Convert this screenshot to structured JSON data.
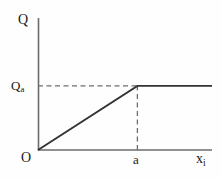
{
  "figure": {
    "background_color": "#fefefe",
    "line_color": "#333333",
    "dash_color": "#6e6e6e",
    "axis_color": "#6b6b6b",
    "text_color": "#1a1a1a"
  },
  "labels": {
    "y_axis": "Q",
    "y_tick_base": "Q",
    "y_tick_sub": "a",
    "origin": "O",
    "x_tick": "a",
    "x_axis_base": "x",
    "x_axis_sub": "i"
  },
  "chart_data": {
    "type": "line",
    "title": "",
    "xlabel": "x_i",
    "ylabel": "Q",
    "grid": false,
    "legend": null,
    "xlim": [
      0,
      1.75
    ],
    "ylim": [
      0,
      2.06
    ],
    "x_ticks": [
      {
        "value": 0,
        "label": "O"
      },
      {
        "value": 1.0,
        "label": "a"
      }
    ],
    "y_ticks": [
      {
        "value": 0,
        "label": ""
      },
      {
        "value": 1.0,
        "label": "Q_a"
      }
    ],
    "series": [
      {
        "name": "Q(x_i)",
        "style": "solid",
        "points": [
          {
            "x": 0.0,
            "y": 0.0
          },
          {
            "x": 1.0,
            "y": 1.0
          },
          {
            "x": 1.75,
            "y": 1.0
          }
        ],
        "description": "Linear rise from origin to (a, Q_a), then constant plateau at Q_a"
      }
    ],
    "annotations": [
      {
        "name": "qa-horizontal-guide",
        "style": "dashed",
        "from": {
          "x": 0.0,
          "y": 1.0
        },
        "to": {
          "x": 1.0,
          "y": 1.0
        }
      },
      {
        "name": "a-vertical-guide",
        "style": "dashed",
        "from": {
          "x": 1.0,
          "y": 0.0
        },
        "to": {
          "x": 1.0,
          "y": 1.0
        }
      }
    ]
  }
}
